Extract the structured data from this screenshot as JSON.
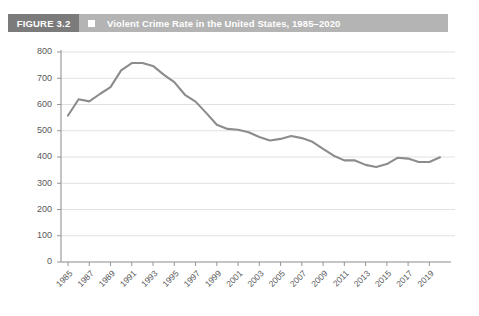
{
  "figure": {
    "number_label": "FIGURE 3.2",
    "bullet_icon": "square-bullet-icon",
    "title": "Violent Crime Rate in the United States, 1985–2020",
    "header_bg_color": "#b4b4b4",
    "number_block_color": "#7b7b7b"
  },
  "chart_data": {
    "type": "line",
    "title": "Violent Crime Rate in the United States, 1985–2020",
    "xlabel": "",
    "ylabel": "",
    "xlim": [
      1985,
      2020
    ],
    "ylim": [
      0,
      800
    ],
    "grid": true,
    "legend": false,
    "line_color": "#8c8c8c",
    "ytick_labels": [
      "800",
      "700",
      "600",
      "500",
      "400",
      "300",
      "200",
      "100",
      "0"
    ],
    "ytick_values": [
      800,
      700,
      600,
      500,
      400,
      300,
      200,
      100,
      0
    ],
    "xtick_labels": [
      "1985",
      "1987",
      "1989",
      "1991",
      "1993",
      "1995",
      "1997",
      "1999",
      "2001",
      "2003",
      "2005",
      "2007",
      "2009",
      "2011",
      "2013",
      "2015",
      "2017",
      "2019"
    ],
    "xtick_values": [
      1985,
      1987,
      1989,
      1991,
      1993,
      1995,
      1997,
      1999,
      2001,
      2003,
      2005,
      2007,
      2009,
      2011,
      2013,
      2015,
      2017,
      2019
    ],
    "x": [
      1985,
      1986,
      1987,
      1988,
      1989,
      1990,
      1991,
      1992,
      1993,
      1994,
      1995,
      1996,
      1997,
      1998,
      1999,
      2000,
      2001,
      2002,
      2003,
      2004,
      2005,
      2006,
      2007,
      2008,
      2009,
      2010,
      2011,
      2012,
      2013,
      2014,
      2015,
      2016,
      2017,
      2018,
      2019,
      2020
    ],
    "values": [
      558,
      620,
      612,
      640,
      666,
      730,
      758,
      758,
      747,
      714,
      685,
      637,
      611,
      568,
      523,
      507,
      504,
      494,
      476,
      463,
      469,
      480,
      472,
      458,
      431,
      405,
      387,
      387,
      370,
      362,
      373,
      397,
      394,
      381,
      381,
      399
    ],
    "series": [
      {
        "name": "Violent crime rate",
        "values": [
          558,
          620,
          612,
          640,
          666,
          730,
          758,
          758,
          747,
          714,
          685,
          637,
          611,
          568,
          523,
          507,
          504,
          494,
          476,
          463,
          469,
          480,
          472,
          458,
          431,
          405,
          387,
          387,
          370,
          362,
          373,
          397,
          394,
          381,
          381,
          399
        ]
      }
    ]
  }
}
